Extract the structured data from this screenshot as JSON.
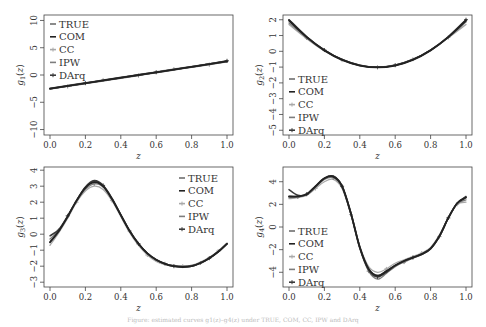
{
  "chart_data": [
    {
      "type": "line",
      "panel": 1,
      "ylabel": "g1(z)",
      "ylabel_main": "g",
      "ylabel_sub": "1",
      "xlabel": "z",
      "xlim": [
        0,
        1
      ],
      "ylim": [
        -11,
        11
      ],
      "xticks": [
        0.0,
        0.2,
        0.4,
        0.6,
        0.8,
        1.0
      ],
      "xtick_labels": [
        "0.0",
        "0.2",
        "0.4",
        "0.6",
        "0.8",
        "1.0"
      ],
      "yticks": [
        -10,
        -5,
        0,
        5,
        10
      ],
      "ytick_labels": [
        "−10",
        "−5",
        "0",
        "5",
        "10"
      ],
      "legend_position": "top-left",
      "legend": [
        "TRUE",
        "COM",
        "CC",
        "IPW",
        "DArq"
      ],
      "x": [
        0.0,
        0.1,
        0.2,
        0.3,
        0.4,
        0.5,
        0.6,
        0.7,
        0.8,
        0.9,
        1.0
      ],
      "series": [
        {
          "name": "TRUE",
          "values": [
            -2.5,
            -2.0,
            -1.5,
            -1.0,
            -0.5,
            0.0,
            0.5,
            1.0,
            1.5,
            2.0,
            2.5
          ]
        },
        {
          "name": "COM",
          "values": [
            -2.5,
            -2.0,
            -1.5,
            -1.0,
            -0.5,
            0.0,
            0.5,
            1.0,
            1.5,
            2.0,
            2.5
          ]
        },
        {
          "name": "CC",
          "values": [
            -2.4,
            -1.9,
            -1.4,
            -0.9,
            -0.4,
            0.1,
            0.6,
            1.1,
            1.6,
            2.1,
            2.6
          ]
        },
        {
          "name": "IPW",
          "values": [
            -2.6,
            -2.1,
            -1.6,
            -1.1,
            -0.6,
            -0.1,
            0.4,
            0.9,
            1.4,
            1.9,
            2.4
          ]
        },
        {
          "name": "DArq",
          "values": [
            -2.5,
            -2.0,
            -1.5,
            -1.0,
            -0.5,
            0.0,
            0.5,
            1.0,
            1.5,
            2.0,
            2.6
          ]
        }
      ]
    },
    {
      "type": "line",
      "panel": 2,
      "ylabel": "g2(z)",
      "ylabel_main": "g",
      "ylabel_sub": "2",
      "xlabel": "z",
      "xlim": [
        0,
        1
      ],
      "ylim": [
        -5.3,
        2.3
      ],
      "xticks": [
        0.0,
        0.2,
        0.4,
        0.6,
        0.8,
        1.0
      ],
      "xtick_labels": [
        "0.0",
        "0.2",
        "0.4",
        "0.6",
        "0.8",
        "1.0"
      ],
      "yticks": [
        -5,
        -4,
        -3,
        -2,
        -1,
        0,
        1,
        2
      ],
      "ytick_labels": [
        "−5",
        "−4",
        "−3",
        "−2",
        "−1",
        "0",
        "1",
        "2"
      ],
      "legend_position": "bottom-left",
      "legend": [
        "TRUE",
        "COM",
        "CC",
        "IPW",
        "DArq"
      ],
      "x": [
        0.0,
        0.1,
        0.2,
        0.3,
        0.4,
        0.5,
        0.6,
        0.7,
        0.8,
        0.9,
        1.0
      ],
      "series": [
        {
          "name": "TRUE",
          "values": [
            2.0,
            0.92,
            0.08,
            -0.52,
            -0.88,
            -1.0,
            -0.88,
            -0.52,
            0.08,
            0.92,
            2.0
          ]
        },
        {
          "name": "COM",
          "values": [
            1.95,
            0.9,
            0.06,
            -0.54,
            -0.9,
            -1.02,
            -0.9,
            -0.54,
            0.06,
            0.9,
            1.95
          ]
        },
        {
          "name": "CC",
          "values": [
            1.7,
            0.8,
            0.02,
            -0.56,
            -0.9,
            -1.0,
            -0.86,
            -0.5,
            0.08,
            0.86,
            1.7
          ]
        },
        {
          "name": "IPW",
          "values": [
            1.8,
            0.85,
            0.05,
            -0.55,
            -0.9,
            -1.02,
            -0.88,
            -0.52,
            0.06,
            0.88,
            1.85
          ]
        },
        {
          "name": "DArq",
          "values": [
            2.0,
            0.92,
            0.08,
            -0.52,
            -0.88,
            -1.0,
            -0.88,
            -0.52,
            0.08,
            0.92,
            2.0
          ]
        }
      ]
    },
    {
      "type": "line",
      "panel": 3,
      "ylabel": "g3(z)",
      "ylabel_main": "g",
      "ylabel_sub": "3",
      "xlabel": "z",
      "xlim": [
        0,
        1
      ],
      "ylim": [
        -3.3,
        4.2
      ],
      "xticks": [
        0.0,
        0.2,
        0.4,
        0.6,
        0.8,
        1.0
      ],
      "xtick_labels": [
        "0.0",
        "0.2",
        "0.4",
        "0.6",
        "0.8",
        "1.0"
      ],
      "yticks": [
        -3,
        -2,
        -1,
        0,
        1,
        2,
        3,
        4
      ],
      "ytick_labels": [
        "−3",
        "−2",
        "−1",
        "0",
        "1",
        "2",
        "3",
        "4"
      ],
      "legend_position": "top-right",
      "legend": [
        "TRUE",
        "COM",
        "CC",
        "IPW",
        "DArq"
      ],
      "x": [
        0.0,
        0.05,
        0.1,
        0.15,
        0.2,
        0.25,
        0.3,
        0.35,
        0.4,
        0.45,
        0.5,
        0.55,
        0.6,
        0.65,
        0.7,
        0.75,
        0.8,
        0.85,
        0.9,
        0.95,
        1.0
      ],
      "series": [
        {
          "name": "TRUE",
          "values": [
            -0.5,
            0.2,
            1.1,
            2.1,
            2.9,
            3.3,
            3.0,
            2.2,
            1.2,
            0.2,
            -0.6,
            -1.2,
            -1.6,
            -1.85,
            -2.0,
            -2.05,
            -2.0,
            -1.8,
            -1.5,
            -1.1,
            -0.6
          ]
        },
        {
          "name": "COM",
          "values": [
            -0.5,
            0.2,
            1.1,
            2.1,
            2.9,
            3.25,
            3.0,
            2.2,
            1.2,
            0.2,
            -0.6,
            -1.2,
            -1.6,
            -1.85,
            -2.0,
            -2.05,
            -2.0,
            -1.8,
            -1.5,
            -1.1,
            -0.6
          ]
        },
        {
          "name": "CC",
          "values": [
            -0.7,
            0.1,
            1.0,
            2.0,
            2.7,
            3.0,
            2.8,
            2.1,
            1.1,
            0.1,
            -0.7,
            -1.3,
            -1.7,
            -1.9,
            -2.0,
            -2.0,
            -1.95,
            -1.75,
            -1.45,
            -1.05,
            -0.55
          ]
        },
        {
          "name": "IPW",
          "values": [
            -0.3,
            0.25,
            1.1,
            2.05,
            2.8,
            3.15,
            2.95,
            2.2,
            1.2,
            0.2,
            -0.6,
            -1.2,
            -1.6,
            -1.85,
            -1.95,
            -2.0,
            -1.95,
            -1.8,
            -1.5,
            -1.1,
            -0.6
          ]
        },
        {
          "name": "DArq",
          "values": [
            -0.1,
            0.3,
            1.15,
            2.1,
            2.95,
            3.35,
            3.05,
            2.25,
            1.2,
            0.2,
            -0.6,
            -1.2,
            -1.6,
            -1.85,
            -2.0,
            -2.05,
            -2.0,
            -1.8,
            -1.5,
            -1.1,
            -0.6
          ]
        }
      ]
    },
    {
      "type": "line",
      "panel": 4,
      "ylabel": "g4(z)",
      "ylabel_main": "g",
      "ylabel_sub": "4",
      "xlabel": "z",
      "xlim": [
        0,
        1
      ],
      "ylim": [
        -5.3,
        5.3
      ],
      "xticks": [
        0.0,
        0.2,
        0.4,
        0.6,
        0.8,
        1.0
      ],
      "xtick_labels": [
        "0.0",
        "0.2",
        "0.4",
        "0.6",
        "0.8",
        "1.0"
      ],
      "yticks": [
        -4,
        -2,
        0,
        2,
        4
      ],
      "ytick_labels": [
        "−4",
        "−2",
        "0",
        "2",
        "4"
      ],
      "legend_position": "bottom-left",
      "legend": [
        "TRUE",
        "COM",
        "CC",
        "IPW",
        "DArq"
      ],
      "x": [
        0.0,
        0.05,
        0.1,
        0.15,
        0.2,
        0.25,
        0.3,
        0.35,
        0.4,
        0.45,
        0.5,
        0.55,
        0.6,
        0.65,
        0.7,
        0.75,
        0.8,
        0.85,
        0.9,
        0.95,
        1.0
      ],
      "series": [
        {
          "name": "TRUE",
          "values": [
            2.7,
            2.7,
            2.9,
            3.6,
            4.3,
            4.5,
            3.6,
            1.2,
            -1.8,
            -3.7,
            -4.3,
            -3.9,
            -3.4,
            -3.0,
            -2.7,
            -2.4,
            -1.9,
            -0.8,
            0.8,
            2.1,
            2.6
          ]
        },
        {
          "name": "COM",
          "values": [
            2.7,
            2.7,
            2.9,
            3.6,
            4.3,
            4.45,
            3.6,
            1.2,
            -1.8,
            -3.7,
            -4.3,
            -3.9,
            -3.4,
            -3.0,
            -2.7,
            -2.4,
            -1.9,
            -0.8,
            0.8,
            2.1,
            2.6
          ]
        },
        {
          "name": "CC",
          "values": [
            2.5,
            2.6,
            2.8,
            3.4,
            4.0,
            4.2,
            3.4,
            1.1,
            -1.7,
            -3.5,
            -4.0,
            -3.7,
            -3.2,
            -2.9,
            -2.6,
            -2.3,
            -1.8,
            -0.7,
            0.8,
            2.0,
            2.2
          ]
        },
        {
          "name": "IPW",
          "values": [
            2.6,
            2.65,
            2.85,
            3.5,
            4.2,
            4.35,
            3.5,
            1.1,
            -1.9,
            -3.9,
            -4.6,
            -4.1,
            -3.5,
            -3.1,
            -2.75,
            -2.45,
            -1.95,
            -0.85,
            0.75,
            2.05,
            2.4
          ]
        },
        {
          "name": "DArq",
          "values": [
            3.3,
            2.8,
            2.9,
            3.6,
            4.3,
            4.5,
            3.6,
            1.2,
            -1.8,
            -3.8,
            -4.4,
            -4.0,
            -3.4,
            -3.0,
            -2.7,
            -2.4,
            -1.9,
            -0.8,
            0.8,
            2.1,
            2.7
          ]
        }
      ]
    }
  ],
  "series_styles": {
    "TRUE": {
      "color": "#6e6e6e",
      "width": 1.6,
      "marker": "dash"
    },
    "COM": {
      "color": "#222222",
      "width": 1.8,
      "marker": "line"
    },
    "CC": {
      "color": "#a9a9a9",
      "width": 1.3,
      "marker": "plus"
    },
    "IPW": {
      "color": "#7d7d7d",
      "width": 1.3,
      "marker": "dash"
    },
    "DArq": {
      "color": "#3a3a3a",
      "width": 1.5,
      "marker": "star"
    }
  },
  "caption": "Figure: estimated curves g1(z)–g4(z) under TRUE, COM, CC, IPW and DArq"
}
